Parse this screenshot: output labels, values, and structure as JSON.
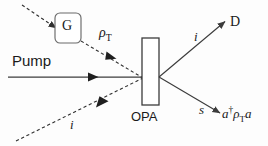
{
  "figure": {
    "width": 268,
    "height": 146,
    "background_color": "#fdfdfd",
    "line_color": "#3c3c3c",
    "text_color": "#1a1a1a"
  },
  "labels": {
    "pump": "Pump",
    "source_box": "G",
    "rho_t": "ρ",
    "rho_t_sub": "T",
    "opa": "OPA",
    "idler_top": "i",
    "detector": "D",
    "signal": "s",
    "idler_bottom": "i",
    "output_operator_a": "a",
    "output_operator_dagger": "†",
    "output_operator_rho": "ρ",
    "output_operator_sub": "T",
    "output_operator_a2": "a"
  },
  "elements": {
    "crystal": {
      "name": "OPA crystal",
      "x": 142,
      "y": 38,
      "width": 17,
      "height": 67,
      "fill": "#ffffff",
      "stroke": "#3c3c3c"
    },
    "source_box": {
      "name": "G source",
      "x": 55,
      "y": 13,
      "width": 26,
      "height": 30,
      "rx": 5,
      "fill": "#ffffff",
      "stroke": "#6a6a6a"
    },
    "beams": [
      {
        "name": "pump-beam",
        "style": "solid",
        "from": [
          8,
          77
        ],
        "to": [
          142,
          77
        ],
        "arrow_at": 0.63
      },
      {
        "name": "rho-t-dashed-into-g",
        "style": "dashed",
        "from": [
          22,
          5
        ],
        "to": [
          55,
          27
        ]
      },
      {
        "name": "rho-t-dashed-to-crystal",
        "style": "dashed",
        "from": [
          81,
          40
        ],
        "to": [
          142,
          77
        ],
        "arrow_at": 0.55
      },
      {
        "name": "idler-input-dashed",
        "style": "dashed",
        "from": [
          16,
          141
        ],
        "to": [
          142,
          77
        ],
        "arrow_at": 0.72
      },
      {
        "name": "idler-output-to-detector",
        "style": "solid",
        "from": [
          160,
          77
        ],
        "to": [
          224,
          22
        ]
      },
      {
        "name": "signal-output",
        "style": "solid",
        "from": [
          160,
          77
        ],
        "to": [
          219,
          113
        ]
      }
    ]
  }
}
